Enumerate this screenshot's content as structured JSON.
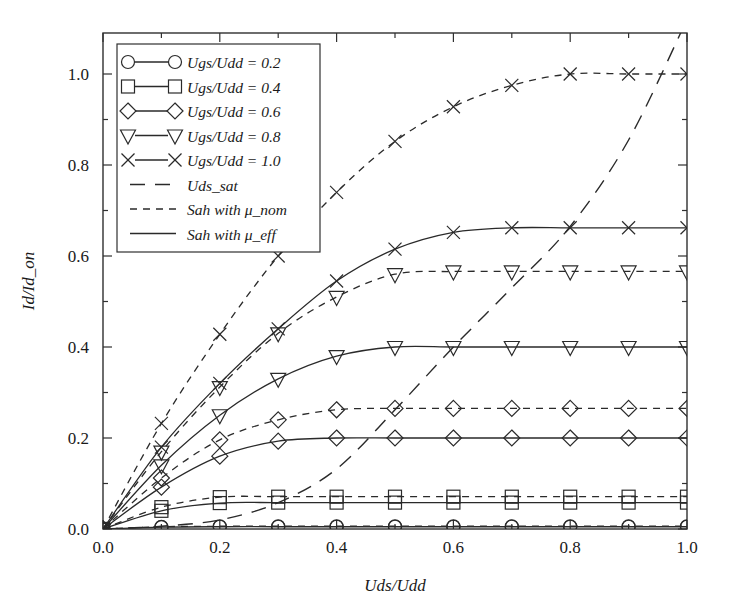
{
  "chart_data": {
    "type": "line",
    "title": "",
    "xlabel": "Uds/Udd",
    "ylabel": "Id/Id_on",
    "xlim": [
      0.0,
      1.0
    ],
    "ylim": [
      0.0,
      1.12
    ],
    "xticks": [
      "0.0",
      "0.2",
      "0.4",
      "0.6",
      "0.8",
      "1.0"
    ],
    "xtick_values": [
      0.0,
      0.2,
      0.4,
      0.6,
      0.8,
      1.0
    ],
    "xminor_values": [
      0.1,
      0.3,
      0.5,
      0.7,
      0.9
    ],
    "yticks": [
      "0.0",
      "0.2",
      "0.4",
      "0.6",
      "0.8",
      "1.0"
    ],
    "ytick_values": [
      0.0,
      0.2,
      0.4,
      0.6,
      0.8,
      1.0
    ],
    "yminor_values": [
      0.1,
      0.3,
      0.5,
      0.7,
      0.9
    ],
    "grid": false,
    "legend_position": "upper-left",
    "x": [
      0.0,
      0.1,
      0.2,
      0.3,
      0.4,
      0.5,
      0.6,
      0.7,
      0.8,
      0.9,
      1.0
    ],
    "series": [
      {
        "name": "Ugs/Udd = 0.2 (Sah with mu_eff)",
        "legend_key": "ugs_02",
        "marker": "circle",
        "line": "solid",
        "model": "mu_eff",
        "values": [
          0.0,
          0.004,
          0.005,
          0.005,
          0.005,
          0.005,
          0.005,
          0.005,
          0.005,
          0.005,
          0.005
        ]
      },
      {
        "name": "Ugs/Udd = 0.2 (Sah with mu_nom)",
        "legend_key": "ugs_02",
        "marker": "circle",
        "line": "dashed",
        "model": "mu_nom",
        "values": [
          0.0,
          0.005,
          0.006,
          0.006,
          0.006,
          0.006,
          0.006,
          0.006,
          0.006,
          0.006,
          0.006
        ]
      },
      {
        "name": "Ugs/Udd = 0.4 (Sah with mu_eff)",
        "legend_key": "ugs_04",
        "marker": "square",
        "line": "solid",
        "model": "mu_eff",
        "values": [
          0.0,
          0.04,
          0.057,
          0.058,
          0.058,
          0.058,
          0.058,
          0.058,
          0.058,
          0.058,
          0.058
        ]
      },
      {
        "name": "Ugs/Udd = 0.4 (Sah with mu_nom)",
        "legend_key": "ugs_04",
        "marker": "square",
        "line": "dashed",
        "model": "mu_nom",
        "values": [
          0.0,
          0.048,
          0.07,
          0.071,
          0.071,
          0.071,
          0.071,
          0.071,
          0.071,
          0.071,
          0.071
        ]
      },
      {
        "name": "Ugs/Udd = 0.6 (Sah with mu_eff)",
        "legend_key": "ugs_06",
        "marker": "diamond",
        "line": "solid",
        "model": "mu_eff",
        "values": [
          0.0,
          0.092,
          0.16,
          0.193,
          0.2,
          0.2,
          0.2,
          0.2,
          0.2,
          0.2,
          0.2
        ]
      },
      {
        "name": "Ugs/Udd = 0.6 (Sah with mu_nom)",
        "legend_key": "ugs_06",
        "marker": "diamond",
        "line": "dashed",
        "model": "mu_nom",
        "values": [
          0.0,
          0.112,
          0.196,
          0.24,
          0.262,
          0.265,
          0.265,
          0.265,
          0.265,
          0.265,
          0.265
        ]
      },
      {
        "name": "Ugs/Udd = 0.8 (Sah with mu_eff)",
        "legend_key": "ugs_08",
        "marker": "triangle-down",
        "line": "solid",
        "model": "mu_eff",
        "values": [
          0.0,
          0.14,
          0.25,
          0.33,
          0.38,
          0.4,
          0.4,
          0.4,
          0.4,
          0.4,
          0.4
        ]
      },
      {
        "name": "Ugs/Udd = 0.8 (Sah with mu_nom)",
        "legend_key": "ugs_08",
        "marker": "triangle-down",
        "line": "dashed",
        "model": "mu_nom",
        "values": [
          0.0,
          0.17,
          0.312,
          0.43,
          0.51,
          0.56,
          0.566,
          0.566,
          0.566,
          0.566,
          0.566
        ]
      },
      {
        "name": "Ugs/Udd = 1.0 (Sah with mu_eff)",
        "legend_key": "ugs_10",
        "marker": "cross",
        "line": "solid",
        "model": "mu_eff",
        "values": [
          0.0,
          0.18,
          0.32,
          0.44,
          0.545,
          0.615,
          0.652,
          0.662,
          0.662,
          0.662,
          0.662
        ]
      },
      {
        "name": "Ugs/Udd = 1.0 (Sah with mu_nom)",
        "legend_key": "ugs_10",
        "marker": "cross",
        "line": "dashed",
        "model": "mu_nom",
        "values": [
          0.0,
          0.232,
          0.428,
          0.6,
          0.74,
          0.852,
          0.928,
          0.975,
          1.0,
          1.0,
          1.0
        ]
      },
      {
        "name": "Uds_sat",
        "legend_key": "uds_sat",
        "marker": "none",
        "line": "long-dashed",
        "model": "sat-locus",
        "values": [
          0.0,
          0.006,
          0.02,
          0.058,
          0.132,
          0.262,
          0.4,
          0.53,
          0.665,
          0.855,
          1.12
        ]
      }
    ],
    "legend_entries": [
      {
        "label": "Ugs/Udd = 0.2",
        "marker": "circle",
        "line": "solid"
      },
      {
        "label": "Ugs/Udd = 0.4",
        "marker": "square",
        "line": "solid"
      },
      {
        "label": "Ugs/Udd = 0.6",
        "marker": "diamond",
        "line": "solid"
      },
      {
        "label": "Ugs/Udd = 0.8",
        "marker": "triangle-down",
        "line": "solid"
      },
      {
        "label": "Ugs/Udd = 1.0",
        "marker": "cross",
        "line": "solid"
      },
      {
        "label": "Uds_sat",
        "marker": "none",
        "line": "long-dashed"
      },
      {
        "label": "Sah with μ_nom",
        "marker": "none",
        "line": "dashed"
      },
      {
        "label": "Sah with μ_eff",
        "marker": "none",
        "line": "solid"
      }
    ],
    "colors": {
      "line": "#2a2a2a",
      "axis": "#303030",
      "background": "#ffffff"
    }
  }
}
